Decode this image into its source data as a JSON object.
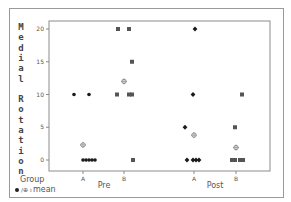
{
  "chart_data": {
    "type": "scatter",
    "title": "",
    "ylabel": "Medial Rotation",
    "xlabel": "Group",
    "ylim": [
      0,
      20
    ],
    "yticks": [
      0,
      5,
      10,
      15,
      20
    ],
    "grid": false,
    "outer_categories": [
      "Pre",
      "Post"
    ],
    "inner_categories": [
      "A",
      "B"
    ],
    "legend": "mean",
    "series": [
      {
        "name": "Pre A",
        "marker": "circle",
        "values": [
          10,
          10,
          0,
          0,
          0,
          0,
          0
        ],
        "mean": 2.3
      },
      {
        "name": "Pre B",
        "marker": "square",
        "values": [
          20,
          20,
          15,
          10,
          10,
          10,
          0
        ],
        "mean": 12
      },
      {
        "name": "Post A",
        "marker": "diamond",
        "values": [
          20,
          10,
          5,
          0,
          0,
          0,
          0
        ],
        "mean": 3.8
      },
      {
        "name": "Post B",
        "marker": "square",
        "values": [
          10,
          5,
          0,
          0,
          0,
          0
        ],
        "mean": 1.9
      }
    ]
  },
  "labels": {
    "ylabel_letters": [
      "M",
      "e",
      "d",
      "i",
      "a",
      "l",
      "",
      "R",
      "o",
      "t",
      "a",
      "t",
      "i",
      "o",
      "n"
    ],
    "group_label": "Group",
    "legend_text": "mean",
    "legend_symbols": "⊕/⊕ ı",
    "ytick_labels": [
      "0",
      "5",
      "10",
      "15",
      "20"
    ],
    "inner_ticks": [
      "A",
      "B",
      "A",
      "B"
    ],
    "outer_ticks": [
      "Pre",
      "Post"
    ]
  }
}
